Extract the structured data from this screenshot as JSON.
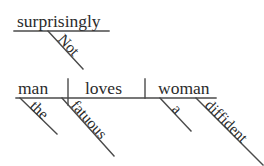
{
  "diagram": {
    "type": "reed-kellogg-sentence-diagram",
    "sentence": "The fatuous man does not surprisingly love a diffident woman",
    "stroke_color": "#4a4a4a",
    "text_color": "#2b2b2b",
    "background_color": "#ffffff",
    "main_clause": {
      "subject": "man",
      "verb": "loves",
      "object": "woman"
    },
    "modifiers": {
      "subject_article": "the",
      "subject_adjective": "fatuous",
      "object_article": "a",
      "object_adjective": "diffident",
      "verb_adverb": "surprisingly",
      "adverb_negator": "Not"
    }
  }
}
